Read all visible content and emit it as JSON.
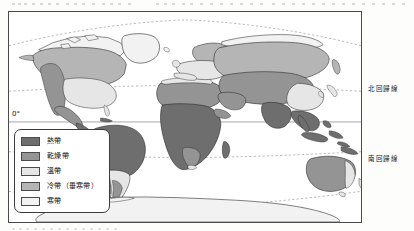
{
  "map": {
    "title_alt": "世界氣候帶分布圖",
    "frame": {
      "x": 8,
      "y": 11,
      "width": 354,
      "height": 212
    },
    "equator_label": "0°",
    "latitude_lines": [
      {
        "name": "arctic-circle",
        "label": "",
        "style": "dashed",
        "y_pct": 12
      },
      {
        "name": "tropic-of-cancer",
        "label": "北回歸線",
        "style": "dashed",
        "y_pct": 35.5
      },
      {
        "name": "equator",
        "label": "0°",
        "style": "solid",
        "y_pct": 52.5
      },
      {
        "name": "tropic-of-capricorn",
        "label": "南回歸線",
        "style": "dashed",
        "y_pct": 68.5
      },
      {
        "name": "antarctic-circle",
        "label": "",
        "style": "dashed",
        "y_pct": 88
      }
    ]
  },
  "legend": {
    "items": [
      {
        "label": "熱帶",
        "color": "#6e6e6e",
        "zone": "tropical"
      },
      {
        "label": "乾燥帶",
        "color": "#949494",
        "zone": "arid"
      },
      {
        "label": "溫帶",
        "color": "#e6e6e6",
        "zone": "temperate"
      },
      {
        "label": "冷帶（垂寒帶）",
        "color": "#b5b5b5",
        "zone": "subarctic"
      },
      {
        "label": "寒帶",
        "color": "#f2f2f2",
        "zone": "polar"
      }
    ]
  },
  "colors": {
    "tropical": "#6e6e6e",
    "arid": "#949494",
    "temperate": "#e6e6e6",
    "subarctic": "#b5b5b5",
    "polar": "#f2f2f2",
    "outline": "#2b2b2b",
    "frame": "#4a4a4a",
    "grid": "#9a9aa5",
    "background": "#ffffff"
  }
}
